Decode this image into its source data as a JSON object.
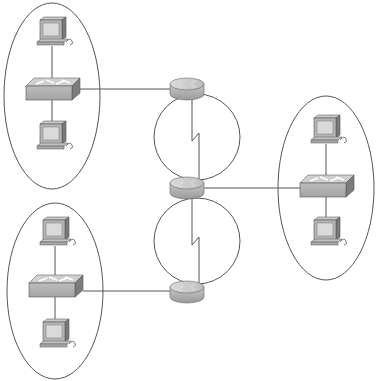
{
  "diagram": {
    "type": "network-topology",
    "colors": {
      "line": "#555555",
      "device_fill": "#b8b8b8",
      "device_dark": "#8a8a8a",
      "screen": "#d8d8d8"
    },
    "lans": [
      {
        "id": "lan-top-left",
        "ellipse": {
          "cx": 52,
          "cy": 96,
          "rx": 48,
          "ry": 93
        },
        "switch": {
          "x": 52,
          "y": 90
        },
        "pcs": [
          {
            "x": 52,
            "y": 36
          },
          {
            "x": 52,
            "y": 140
          }
        ]
      },
      {
        "id": "lan-bottom-left",
        "ellipse": {
          "cx": 55,
          "cy": 291,
          "rx": 48,
          "ry": 88
        },
        "switch": {
          "x": 55,
          "y": 287
        },
        "pcs": [
          {
            "x": 55,
            "y": 236
          },
          {
            "x": 55,
            "y": 338
          }
        ]
      },
      {
        "id": "lan-right",
        "ellipse": {
          "cx": 326,
          "cy": 188,
          "rx": 48,
          "ry": 92
        },
        "switch": {
          "x": 326,
          "y": 187
        },
        "pcs": [
          {
            "x": 326,
            "y": 134
          },
          {
            "x": 326,
            "y": 236
          }
        ]
      }
    ],
    "routers": [
      {
        "id": "router-top",
        "x": 187,
        "y": 88
      },
      {
        "id": "router-middle",
        "x": 187,
        "y": 187
      },
      {
        "id": "router-bottom",
        "x": 187,
        "y": 291
      }
    ],
    "wan_links": [
      {
        "id": "serial-top",
        "circle": {
          "cx": 197,
          "cy": 137,
          "r": 43
        }
      },
      {
        "id": "serial-bottom",
        "circle": {
          "cx": 197,
          "cy": 241,
          "r": 43
        }
      }
    ]
  }
}
